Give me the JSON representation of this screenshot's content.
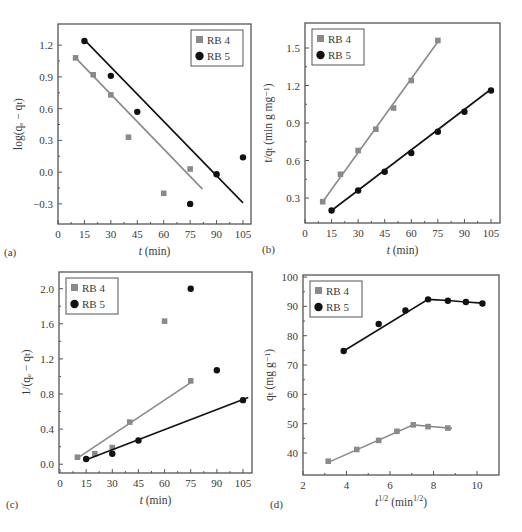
{
  "chart_data": [
    {
      "panel": "(a)",
      "type": "scatter",
      "title": "",
      "xlabel": "t (min)",
      "ylabel": "log(q_e − q_t)",
      "xlim": [
        0,
        110
      ],
      "ylim": [
        -0.49,
        1.4
      ],
      "xticks": [
        0,
        15,
        30,
        45,
        60,
        75,
        90,
        105
      ],
      "yticks": [
        -0.3,
        0.0,
        0.3,
        0.6,
        0.9,
        1.2
      ],
      "ytick_labels": [
        "−0.3",
        "0.0",
        "0.3",
        "0.6",
        "0.9",
        "1.2"
      ],
      "legend_position": "upper right",
      "series": [
        {
          "name": "RB 4",
          "marker": "square",
          "color": "#8a8a8a",
          "x": [
            10,
            20,
            30,
            40,
            60,
            75
          ],
          "y": [
            1.08,
            0.92,
            0.73,
            0.33,
            -0.2,
            0.03
          ],
          "fit_line": {
            "x": [
              10,
              82
            ],
            "y": [
              1.08,
              -0.16
            ]
          }
        },
        {
          "name": "RB 5",
          "marker": "circle",
          "color": "#111111",
          "x": [
            15,
            30,
            45,
            75,
            90,
            105
          ],
          "y": [
            1.24,
            0.91,
            0.57,
            -0.3,
            -0.02,
            0.14
          ],
          "fit_line": {
            "x": [
              15,
              105
            ],
            "y": [
              1.25,
              -0.29
            ]
          }
        }
      ]
    },
    {
      "panel": "(b)",
      "type": "line",
      "title": "",
      "xlabel": "t (min)",
      "ylabel": "t/q_t (min g mg^−1)",
      "xlim": [
        0,
        110
      ],
      "ylim": [
        0.1,
        1.7
      ],
      "xticks": [
        0,
        15,
        30,
        45,
        60,
        75,
        90,
        105
      ],
      "yticks": [
        0.3,
        0.6,
        0.9,
        1.2,
        1.5
      ],
      "ytick_labels": [
        "0.3",
        "0.6",
        "0.9",
        "1.2",
        "1.5"
      ],
      "legend_position": "upper left",
      "series": [
        {
          "name": "RB 4",
          "marker": "square",
          "color": "#8a8a8a",
          "x": [
            10,
            20,
            30,
            40,
            50,
            60,
            75
          ],
          "y": [
            0.27,
            0.49,
            0.68,
            0.85,
            1.02,
            1.24,
            1.56
          ],
          "fit_line": {
            "x": [
              10,
              75
            ],
            "y": [
              0.27,
              1.55
            ]
          }
        },
        {
          "name": "RB 5",
          "marker": "circle",
          "color": "#111111",
          "x": [
            15,
            30,
            45,
            60,
            75,
            90,
            105
          ],
          "y": [
            0.2,
            0.36,
            0.51,
            0.66,
            0.83,
            0.99,
            1.16
          ],
          "fit_line": {
            "x": [
              15,
              105
            ],
            "y": [
              0.2,
              1.17
            ]
          }
        }
      ]
    },
    {
      "panel": "(c)",
      "type": "scatter",
      "title": "",
      "xlabel": "t (min)",
      "ylabel": "1/(q_e − q_t)",
      "xlim": [
        0,
        110
      ],
      "ylim": [
        -0.1,
        2.19
      ],
      "xticks": [
        0,
        15,
        30,
        45,
        60,
        75,
        90,
        105
      ],
      "yticks": [
        0.0,
        0.4,
        0.8,
        1.2,
        1.6,
        2.0
      ],
      "ytick_labels": [
        "0.0",
        "0.4",
        "0.8",
        "1.2",
        "1.6",
        "2.0"
      ],
      "legend_position": "upper left",
      "series": [
        {
          "name": "RB 4",
          "marker": "square",
          "color": "#8a8a8a",
          "x": [
            10,
            20,
            30,
            40,
            60,
            75
          ],
          "y": [
            0.08,
            0.12,
            0.19,
            0.48,
            1.63,
            0.95
          ],
          "fit_line": {
            "x": [
              10,
              75
            ],
            "y": [
              0.07,
              0.93
            ]
          }
        },
        {
          "name": "RB 5",
          "marker": "circle",
          "color": "#111111",
          "x": [
            15,
            30,
            45,
            75,
            90,
            105
          ],
          "y": [
            0.06,
            0.12,
            0.27,
            2.0,
            1.07,
            0.73
          ],
          "fit_line": {
            "x": [
              15,
              108
            ],
            "y": [
              0.05,
              0.76
            ]
          }
        }
      ]
    },
    {
      "panel": "(d)",
      "type": "line",
      "title": "",
      "xlabel": "t^1/2 (min^1/2)",
      "ylabel": "q_t (mg g^−1)",
      "xlim": [
        2,
        11
      ],
      "ylim": [
        32.5,
        100.7
      ],
      "xticks": [
        2,
        4,
        6,
        8,
        10
      ],
      "yticks": [
        40,
        50,
        60,
        70,
        80,
        90,
        100
      ],
      "ytick_labels": [
        "40",
        "50",
        "60",
        "70",
        "80",
        "90",
        "100"
      ],
      "legend_position": "upper left",
      "series": [
        {
          "name": "RB 4",
          "marker": "square",
          "color": "#8a8a8a",
          "x": [
            3.16,
            4.47,
            5.48,
            6.32,
            7.07,
            7.75,
            8.66
          ],
          "y": [
            37.2,
            41.2,
            44.3,
            47.4,
            49.6,
            49.0,
            48.5
          ],
          "fit_line": {
            "x": [
              3.16,
              7.07,
              7.75,
              8.85
            ],
            "y": [
              36.8,
              49.6,
              49.1,
              48.4
            ]
          }
        },
        {
          "name": "RB 5",
          "marker": "circle",
          "color": "#111111",
          "x": [
            3.87,
            5.48,
            6.71,
            7.75,
            8.66,
            9.49,
            10.25
          ],
          "y": [
            74.8,
            84.0,
            88.6,
            92.4,
            91.9,
            91.5,
            91.0
          ],
          "fit_line": {
            "x": [
              3.87,
              7.75,
              8.66,
              9.49,
              10.25
            ],
            "y": [
              74.8,
              92.4,
              92.0,
              91.5,
              91.1
            ]
          }
        }
      ]
    }
  ],
  "panels": {
    "a": {
      "label": "(a)",
      "xlabel_t": "t",
      "xlabel_rest": " (min)",
      "ylabel": "log(qₑ − qₜ)"
    },
    "b": {
      "label": "(b)",
      "xlabel_t": "t",
      "xlabel_rest": " (min)",
      "ylabel": "t/qₜ (min g mg⁻¹)"
    },
    "c": {
      "label": "(c)",
      "xlabel_t": "t",
      "xlabel_rest": " (min)",
      "ylabel": "1/(qₑ − qₜ)"
    },
    "d": {
      "label": "(d)",
      "xlabel_t": "t",
      "xlabel_sup": "1/2",
      "xlabel_rest": " (min",
      "xlabel_sup2": "1/2",
      "xlabel_close": ")",
      "ylabel": "qₜ (mg g⁻¹)"
    }
  },
  "legend": {
    "rb4": "RB 4",
    "rb5": "RB 5"
  },
  "colors": {
    "rb4": "#8a8a8a",
    "rb5": "#111111",
    "frame": "#555555",
    "text": "#3a3a3a"
  }
}
